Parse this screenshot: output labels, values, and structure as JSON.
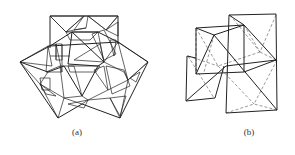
{
  "figure": {
    "panels": [
      {
        "id": "a",
        "caption": "(a)",
        "description": "Polyhedral packing of triangular faces with hatched and stippled shading"
      },
      {
        "id": "b",
        "caption": "(b)",
        "description": "Wireframe of polyhedra with solid visible edges and dashed hidden edges"
      }
    ]
  },
  "colors": {
    "line": "#222222",
    "hidden_line": "#555555",
    "stipple": "#2a2a2a",
    "background": "#ffffff"
  }
}
